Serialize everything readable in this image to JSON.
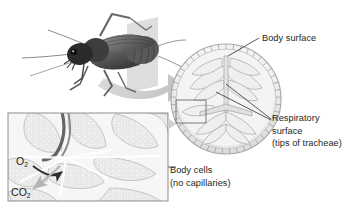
{
  "figure": {
    "background_color": "#ffffff",
    "text_color": "#231f20"
  },
  "labels": {
    "body_surface": "Body surface",
    "respiratory_line1": "Respiratory",
    "respiratory_line2": "surface",
    "respiratory_line3": "(tips of tracheae)",
    "body_cells_line1": "Body cells",
    "body_cells_line2": "(no capillaries)",
    "oxygen": "O",
    "oxygen_sub": "2",
    "carbon_dioxide": "CO",
    "carbon_dioxide_sub": "2"
  },
  "illustrations": {
    "insect": "cricket-illustration",
    "cross_section": "body-cross-section-illustration",
    "inset": "magnified-tissue-inset",
    "transition_arrow": "curved-gray-arrow",
    "callout_box": "magnification-callout-box",
    "o2_arrow": "oxygen-inflow-arrow",
    "co2_arrow": "carbon-dioxide-outflow-arrow"
  },
  "colors": {
    "leader_line": "#3a3a3a",
    "inset_border": "#8d8d8d",
    "arrow_gray": "#c9c9c9",
    "tissue_light": "#e9e9e9",
    "tissue_mid": "#cfcfcf",
    "tissue_dark": "#9a9a9a",
    "insect_dark": "#4a4a4a"
  }
}
